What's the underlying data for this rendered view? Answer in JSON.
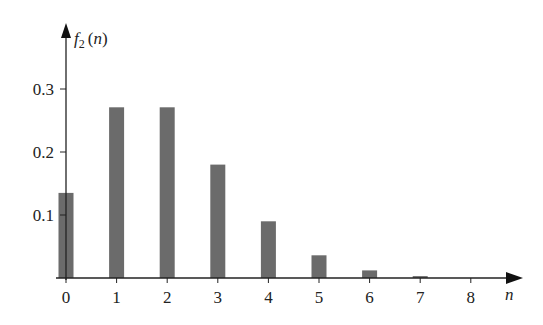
{
  "chart_data": {
    "type": "bar",
    "title": "",
    "xlabel": "n",
    "ylabel": "f2(n)",
    "ylabel_parts": {
      "f": "f",
      "sub": "2",
      "arg": "(n)"
    },
    "categories": [
      "0",
      "1",
      "2",
      "3",
      "4",
      "5",
      "6",
      "7",
      "8"
    ],
    "values": [
      0.135,
      0.271,
      0.271,
      0.18,
      0.09,
      0.036,
      0.012,
      0.003,
      0.001
    ],
    "yticks": [
      "0.1",
      "0.2",
      "0.3"
    ],
    "ytick_values": [
      0.1,
      0.2,
      0.3
    ],
    "ylim": [
      0,
      0.36
    ],
    "grid": false,
    "legend": null,
    "bar_color": "#6b6b6b"
  }
}
